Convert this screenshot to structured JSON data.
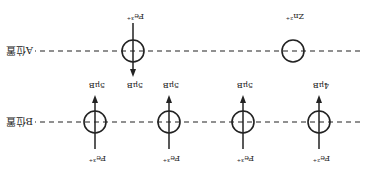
{
  "diagram": {
    "orientation": "rotated 180 degrees",
    "rows": [
      {
        "id": "B",
        "label": "B位置",
        "ions": [
          {
            "ion": "Fe²⁺",
            "moment": "4μB",
            "spin": "up"
          },
          {
            "ion": "Fe³⁺",
            "moment": "5μB",
            "spin": "up"
          },
          {
            "ion": "Fe³⁺",
            "moment": "5μB",
            "spin": "up"
          },
          {
            "ion": "Fe³⁺",
            "moment": "5μB",
            "spin": "up"
          }
        ]
      },
      {
        "id": "A",
        "label": "A位置",
        "ions": [
          {
            "ion": "Zn²⁺",
            "moment": "",
            "spin": "none"
          },
          {
            "ion": "Fe³⁺",
            "moment": "5μB",
            "spin": "down"
          }
        ]
      }
    ],
    "colors": {
      "line": "#222222",
      "background": "#ffffff"
    }
  }
}
